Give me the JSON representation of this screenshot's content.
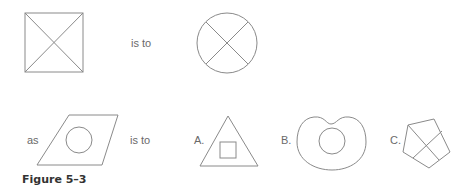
{
  "figure": {
    "caption": "Figure 5–3",
    "row1": {
      "connector": "is to"
    },
    "row2": {
      "prefix": "as",
      "connector": "is to"
    },
    "options": [
      {
        "label": "A.",
        "shape": "triangle-with-inner-square"
      },
      {
        "label": "B.",
        "shape": "kidney-with-inner-circle"
      },
      {
        "label": "C.",
        "shape": "pentagon-with-cross"
      }
    ],
    "shapes": {
      "premise_a": "square-with-diagonals",
      "premise_b": "circle-with-cross",
      "question": "parallelogram-with-inner-circle"
    },
    "stroke_color": "#8a8a8a"
  }
}
